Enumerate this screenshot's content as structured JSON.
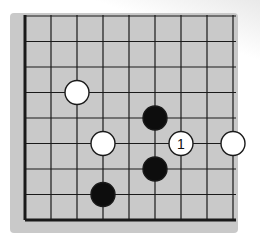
{
  "diagram": {
    "type": "go-board-fragment",
    "board": {
      "columns": 9,
      "rows": 9,
      "thick_edges": [
        "left",
        "bottom"
      ],
      "background_color": "#c9c9c9",
      "line_color": "#1a1a1a"
    },
    "stones": [
      {
        "color": "white",
        "col": 2,
        "row": 3,
        "label": ""
      },
      {
        "color": "white",
        "col": 3,
        "row": 5,
        "label": ""
      },
      {
        "color": "black",
        "col": 5,
        "row": 4,
        "label": ""
      },
      {
        "color": "white",
        "col": 6,
        "row": 5,
        "label": "1"
      },
      {
        "color": "white",
        "col": 8,
        "row": 5,
        "label": ""
      },
      {
        "color": "black",
        "col": 5,
        "row": 6,
        "label": ""
      },
      {
        "color": "black",
        "col": 3,
        "row": 7,
        "label": ""
      }
    ],
    "move_label": "1"
  }
}
